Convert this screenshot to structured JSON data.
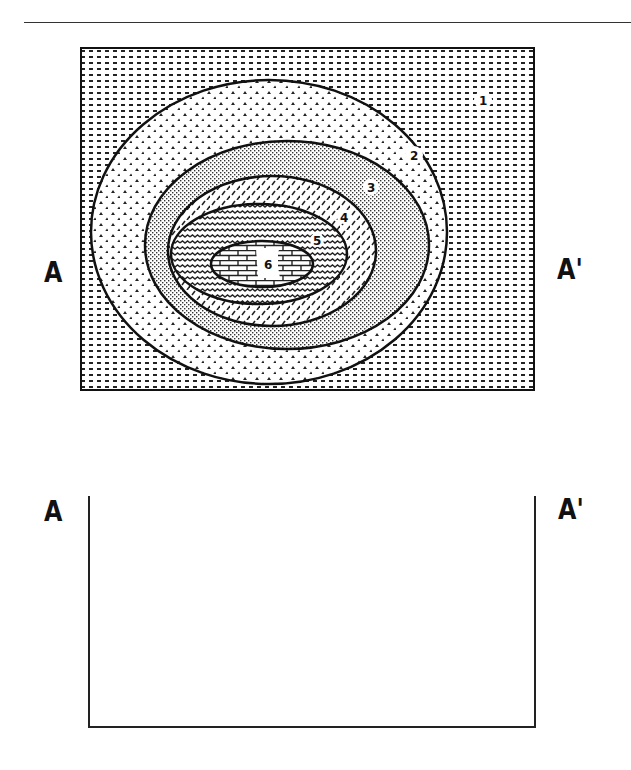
{
  "figure": {
    "type": "geologic map with blank cross-section",
    "map": {
      "structure": "concentric elliptical outcrop pattern (dome or basin)",
      "units": [
        {
          "number": "1",
          "pattern": "dashed dots (horizontal dashes)",
          "position": "outermost"
        },
        {
          "number": "2",
          "pattern": "chevron / arrowhead marks",
          "position": "second ring"
        },
        {
          "number": "3",
          "pattern": "fine stipple",
          "position": "third ring"
        },
        {
          "number": "4",
          "pattern": "diagonal dashes",
          "position": "fourth ring"
        },
        {
          "number": "5",
          "pattern": "wavy lines",
          "position": "fifth ring"
        },
        {
          "number": "6",
          "pattern": "brick",
          "position": "core"
        }
      ],
      "left_label": "A",
      "right_label": "A'"
    },
    "cross_section": {
      "left_label": "A",
      "right_label": "A'",
      "content": "blank"
    }
  }
}
